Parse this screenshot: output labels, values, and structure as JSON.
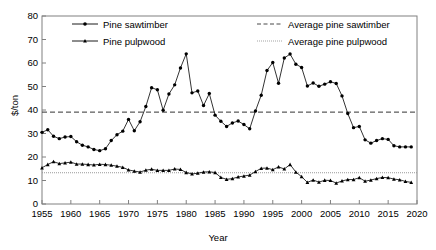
{
  "chart_data": {
    "type": "line",
    "title": "",
    "xlabel": "Year",
    "ylabel": "$/ton",
    "xlim": [
      1955,
      2020
    ],
    "ylim": [
      0,
      80
    ],
    "yticks": [
      0,
      10,
      20,
      30,
      40,
      50,
      60,
      70,
      80
    ],
    "xticks": [
      1955,
      1960,
      1965,
      1970,
      1975,
      1980,
      1985,
      1990,
      1995,
      2000,
      2005,
      2010,
      2015,
      2020
    ],
    "grid": false,
    "legend_position": "inside-top",
    "x": [
      1955,
      1956,
      1957,
      1958,
      1959,
      1960,
      1961,
      1962,
      1963,
      1964,
      1965,
      1966,
      1967,
      1968,
      1969,
      1970,
      1971,
      1972,
      1973,
      1974,
      1975,
      1976,
      1977,
      1978,
      1979,
      1980,
      1981,
      1982,
      1983,
      1984,
      1985,
      1986,
      1987,
      1988,
      1989,
      1990,
      1991,
      1992,
      1993,
      1994,
      1995,
      1996,
      1997,
      1998,
      1999,
      2000,
      2001,
      2002,
      2003,
      2004,
      2005,
      2006,
      2007,
      2008,
      2009,
      2010,
      2011,
      2012,
      2013,
      2014,
      2015,
      2016,
      2017,
      2018,
      2019
    ],
    "series": [
      {
        "name": "Pine sawtimber",
        "marker": "circle",
        "linestyle": "solid",
        "color": "#000000",
        "values": [
          30.5,
          31.6,
          28.8,
          27.8,
          28.5,
          28.7,
          26.5,
          25.0,
          24.3,
          23.2,
          22.7,
          23.5,
          27.0,
          29.5,
          31.0,
          36.0,
          31.2,
          35.0,
          41.5,
          49.5,
          48.6,
          39.9,
          46.8,
          50.7,
          57.9,
          63.9,
          47.3,
          48.1,
          41.9,
          47.0,
          37.8,
          35.2,
          33.0,
          34.5,
          35.3,
          33.8,
          32.0,
          39.6,
          46.3,
          56.8,
          60.2,
          51.4,
          62.1,
          63.8,
          59.5,
          58.1,
          50.2,
          51.5,
          50.1,
          51.0,
          52.0,
          51.3,
          46.0,
          38.5,
          32.5,
          33.0,
          27.3,
          25.9,
          27.0,
          27.8,
          27.5,
          24.8,
          24.3,
          24.3,
          24.3
        ]
      },
      {
        "name": "Pine pulpwood",
        "marker": "triangle",
        "linestyle": "solid",
        "color": "#000000",
        "values": [
          15.4,
          16.8,
          18.0,
          17.2,
          17.5,
          17.8,
          17.0,
          17.0,
          16.8,
          16.6,
          16.9,
          16.8,
          16.5,
          16.1,
          15.6,
          14.5,
          14.0,
          13.6,
          14.4,
          14.8,
          14.3,
          14.3,
          14.3,
          14.9,
          14.7,
          13.4,
          12.8,
          13.1,
          13.6,
          13.7,
          13.4,
          11.3,
          10.5,
          10.8,
          11.5,
          11.9,
          12.3,
          13.8,
          15.2,
          15.3,
          14.6,
          15.8,
          14.9,
          16.8,
          13.6,
          11.6,
          9.2,
          10.2,
          9.3,
          10.1,
          10.0,
          8.9,
          9.8,
          10.4,
          10.4,
          11.2,
          9.7,
          10.2,
          10.8,
          11.3,
          11.2,
          10.6,
          10.3,
          9.6,
          9.2
        ]
      }
    ],
    "reference_lines": [
      {
        "name": "Average pine sawtimber",
        "value": 39.1,
        "linestyle": "dashed",
        "color": "#333333"
      },
      {
        "name": "Average pine pulpwood",
        "value": 13.3,
        "linestyle": "dotted",
        "color": "#999999"
      }
    ]
  },
  "legend": {
    "entries": [
      {
        "label": "Pine sawtimber"
      },
      {
        "label": "Pine pulpwood"
      },
      {
        "label": "Average pine sawtimber"
      },
      {
        "label": "Average pine pulpwood"
      }
    ]
  },
  "axes": {
    "ylabel": "$/ton",
    "xlabel": "Year",
    "ytick_labels": [
      "0",
      "10",
      "20",
      "30",
      "40",
      "50",
      "60",
      "70",
      "80"
    ],
    "xtick_labels": [
      "1955",
      "1960",
      "1965",
      "1970",
      "1975",
      "1980",
      "1985",
      "1990",
      "1995",
      "2000",
      "2005",
      "2010",
      "2015",
      "2020"
    ]
  }
}
